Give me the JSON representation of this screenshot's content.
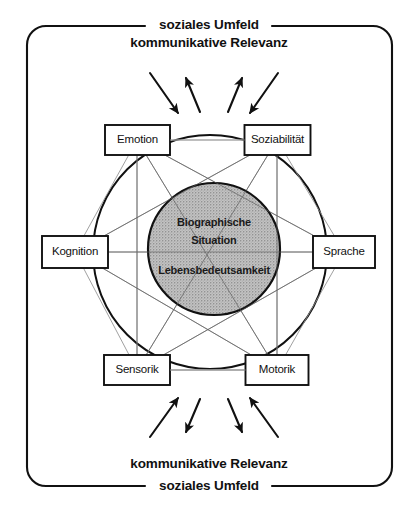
{
  "diagram": {
    "title_top": {
      "line1": "soziales Umfeld",
      "line2": "kommunikative Relevanz"
    },
    "title_bottom": {
      "line1": "kommunikative Relevanz",
      "line2": "soziales Umfeld"
    },
    "core": {
      "line1": "Biographische",
      "line2": "Situation",
      "line3": "Lebensbedeutsamkeit",
      "fill": "#b4b4b4",
      "stroke": "#111111",
      "cx": 214,
      "cy": 249,
      "r": 66
    },
    "nodes": [
      {
        "id": "emotion",
        "label": "Emotion",
        "x": 137.5,
        "y": 140,
        "w": 65,
        "h": 30
      },
      {
        "id": "soziabilitaet",
        "label": "Soziabilität",
        "x": 277.5,
        "y": 140,
        "w": 66,
        "h": 30
      },
      {
        "id": "kognition",
        "label": "Kognition",
        "x": 75,
        "y": 252,
        "w": 66,
        "h": 32
      },
      {
        "id": "sprache",
        "label": "Sprache",
        "x": 344,
        "y": 252,
        "w": 62,
        "h": 32
      },
      {
        "id": "sensorik",
        "label": "Sensorik",
        "x": 137,
        "y": 370,
        "w": 66,
        "h": 30
      },
      {
        "id": "motorik",
        "label": "Motorik",
        "x": 277,
        "y": 370,
        "w": 63,
        "h": 30
      }
    ],
    "arrows_top": [
      {
        "id": "top-arrow-1",
        "dir": "down-in",
        "x1": 150,
        "y1": 73,
        "x2": 178,
        "y2": 113
      },
      {
        "id": "top-arrow-2",
        "dir": "up-out",
        "x1": 200,
        "y1": 112,
        "x2": 186,
        "y2": 78
      },
      {
        "id": "top-arrow-3",
        "dir": "up-out",
        "x1": 228,
        "y1": 112,
        "x2": 242,
        "y2": 78
      },
      {
        "id": "top-arrow-4",
        "dir": "down-in",
        "x1": 278,
        "y1": 73,
        "x2": 250,
        "y2": 113
      }
    ],
    "arrows_bottom": [
      {
        "id": "bottom-arrow-1",
        "dir": "up-in",
        "x1": 150,
        "y1": 437,
        "x2": 178,
        "y2": 398
      },
      {
        "id": "bottom-arrow-2",
        "dir": "down-out",
        "x1": 200,
        "y1": 399,
        "x2": 186,
        "y2": 432
      },
      {
        "id": "bottom-arrow-3",
        "dir": "down-out",
        "x1": 228,
        "y1": 399,
        "x2": 242,
        "y2": 432
      },
      {
        "id": "bottom-arrow-4",
        "dir": "up-in",
        "x1": 278,
        "y1": 437,
        "x2": 250,
        "y2": 398
      }
    ],
    "frame": {
      "x": 27,
      "y": 26,
      "w": 365,
      "h": 460,
      "radius": 19,
      "stroke": "#111111",
      "gap_left_x": 145,
      "gap_right_x": 272
    },
    "ring": {
      "cx": 210,
      "cy": 252,
      "rx": 117,
      "ry": 117,
      "stroke": "#111111"
    },
    "connector_color": "#9a9a9a"
  }
}
